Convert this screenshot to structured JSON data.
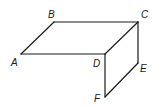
{
  "diagram": {
    "type": "geometry-figure",
    "points": {
      "A": {
        "label": "A",
        "x": 21,
        "y": 54
      },
      "B": {
        "label": "B",
        "x": 54,
        "y": 22
      },
      "C": {
        "label": "C",
        "x": 138,
        "y": 22
      },
      "D": {
        "label": "D",
        "x": 105,
        "y": 54
      },
      "E": {
        "label": "E",
        "x": 138,
        "y": 63
      },
      "F": {
        "label": "F",
        "x": 105,
        "y": 97
      }
    },
    "edges": [
      [
        "A",
        "B"
      ],
      [
        "B",
        "C"
      ],
      [
        "A",
        "D"
      ],
      [
        "D",
        "C"
      ],
      [
        "C",
        "E"
      ],
      [
        "D",
        "F"
      ],
      [
        "F",
        "E"
      ]
    ],
    "stroke_color": "#1a1a1a"
  }
}
